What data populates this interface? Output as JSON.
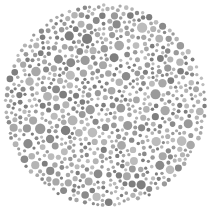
{
  "plate": {
    "type": "ishihara-style dot plate (grayscale)",
    "background": "#ffffff",
    "center": [
      105,
      105
    ],
    "radius": 102,
    "colors": [
      "#8a8a8a",
      "#9a9a9a",
      "#a8a8a8",
      "#b4b4b4",
      "#bcbcbc",
      "#7e7e7e"
    ],
    "dot_radius_range": [
      1.6,
      5.2
    ],
    "dot_count": 1100,
    "seed": 1337,
    "hidden_figure": ""
  }
}
